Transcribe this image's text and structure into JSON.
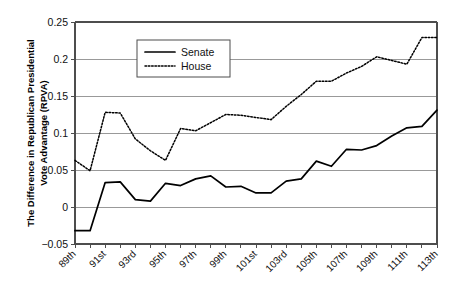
{
  "chart_data": {
    "type": "line",
    "title": "",
    "xlabel": "",
    "ylabel": "The Difference in Republican Presidential Vote Advantage (RPVA)",
    "ylim": [
      -0.05,
      0.25
    ],
    "ytick_labels": [
      "0.25",
      "0.2",
      "0.15",
      "0.1",
      "0.05",
      "0",
      "−0.05"
    ],
    "ytick_values": [
      0.25,
      0.2,
      0.15,
      0.1,
      0.05,
      0,
      -0.05
    ],
    "grid": true,
    "legend_position": "upper-left-inside",
    "x": [
      "89th",
      "90th",
      "91st",
      "92nd",
      "93rd",
      "94th",
      "95th",
      "96th",
      "97th",
      "98th",
      "99th",
      "100th",
      "101st",
      "102nd",
      "103rd",
      "104th",
      "105th",
      "106th",
      "107th",
      "108th",
      "109th",
      "110th",
      "111th",
      "112th",
      "113th"
    ],
    "xtick_labels_shown": [
      "89th",
      "91st",
      "93rd",
      "95th",
      "97th",
      "99th",
      "101st",
      "103rd",
      "105th",
      "107th",
      "109th",
      "111th",
      "113th"
    ],
    "series": [
      {
        "name": "Senate",
        "style": "solid",
        "color": "#000000",
        "values": [
          -0.032,
          -0.032,
          0.033,
          0.034,
          0.01,
          0.008,
          0.032,
          0.029,
          0.038,
          0.042,
          0.027,
          0.028,
          0.019,
          0.019,
          0.035,
          0.038,
          0.062,
          0.055,
          0.078,
          0.077,
          0.083,
          0.096,
          0.107,
          0.109,
          0.131
        ]
      },
      {
        "name": "House",
        "style": "dotted",
        "color": "#000000",
        "values": [
          0.063,
          0.049,
          0.128,
          0.127,
          0.092,
          0.076,
          0.063,
          0.106,
          0.103,
          0.114,
          0.125,
          0.124,
          0.121,
          0.118,
          0.136,
          0.152,
          0.17,
          0.17,
          0.181,
          0.19,
          0.203,
          0.198,
          0.193,
          0.229,
          0.229
        ]
      }
    ]
  },
  "legend": {
    "entries": [
      {
        "label": "Senate"
      },
      {
        "label": "House"
      }
    ]
  },
  "axes": {
    "y_axis_title": "The Difference in Republican Presidential",
    "y_axis_title_line2": "Vote Advantage (RPVA)"
  }
}
